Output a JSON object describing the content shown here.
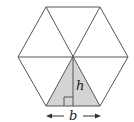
{
  "diagram": {
    "shape": "regular-hexagon",
    "triangles": 6,
    "shaded_triangle": "bottom",
    "labels": {
      "height": "h",
      "base": "b"
    },
    "colors": {
      "stroke": "#555555",
      "shade": "#d4d4d4",
      "background": "#ffffff",
      "text": "#222222"
    },
    "vertices": {
      "top_left": [
        46,
        7
      ],
      "top_right": [
        100,
        7
      ],
      "right": [
        128,
        57
      ],
      "bottom_right": [
        100,
        106
      ],
      "bottom_left": [
        46,
        106
      ],
      "left": [
        18,
        57
      ],
      "center": [
        73,
        57
      ]
    },
    "annotations": {
      "height_line": "vertical from center to base midpoint",
      "right_angle_marker": true,
      "base_arrow": "double-headed arrow spanning base below hexagon"
    }
  }
}
